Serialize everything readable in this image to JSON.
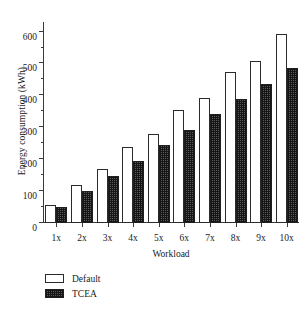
{
  "chart_data": {
    "type": "bar",
    "title": "",
    "xlabel": "Workload",
    "ylabel": "Energy consumption (kWh)",
    "categories": [
      "1x",
      "2x",
      "3x",
      "4x",
      "5x",
      "6x",
      "7x",
      "8x",
      "9x",
      "10x"
    ],
    "series": [
      {
        "name": "Default",
        "values": [
          57,
          120,
          168,
          237,
          280,
          355,
          393,
          473,
          507,
          591
        ]
      },
      {
        "name": "TCEA",
        "values": [
          51,
          99,
          147,
          195,
          243,
          292,
          341,
          389,
          437,
          487
        ]
      }
    ],
    "ylim": [
      0,
      630
    ],
    "yticks": [
      0,
      100,
      200,
      300,
      400,
      500,
      600
    ],
    "ytick_labels": [
      "0",
      "100",
      "200",
      "300",
      "400",
      "500",
      "600"
    ],
    "yminor_ticks": [
      50,
      150,
      250,
      350,
      450,
      550
    ],
    "grid": false,
    "legend_position": "below-left",
    "legend": [
      {
        "label": "Default",
        "swatch": "hollow-white"
      },
      {
        "label": "TCEA",
        "swatch": "dark-crosshatch"
      }
    ],
    "colors": {
      "default_fill": "#ffffff",
      "default_edge": "#2b2b2b",
      "tcea_fill": "#5a5a5a",
      "tcea_edge": "#1f1f1f",
      "axis": "#3a3a3a",
      "text": "#1a1a1a",
      "background": "#ffffff"
    }
  }
}
